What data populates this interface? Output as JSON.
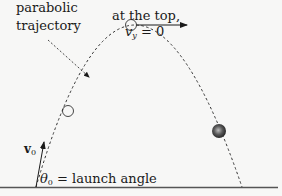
{
  "diagram": {
    "labels": {
      "trajectory_line1": "parabolic",
      "trajectory_line2": "trajectory",
      "top_line1": "at the top,",
      "vy_symbol": "v",
      "vy_sub": "y",
      "vy_value": " = 0",
      "v0_symbol": "v",
      "v0_sub": "0",
      "theta_symbol": "θ",
      "theta_sub": "0",
      "theta_text": " = launch angle"
    },
    "colors": {
      "background": "#f7f7f6",
      "ink": "#1a1a1a",
      "ground": "#555555",
      "ball": "#444444"
    }
  }
}
